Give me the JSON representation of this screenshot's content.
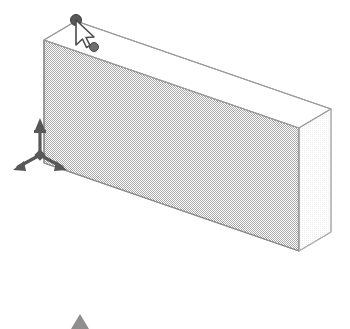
{
  "app": {
    "view_mode": "3D Isometric",
    "background_color": "#ffffff"
  },
  "viewport": {
    "width": 350,
    "height": 329,
    "name": "3d-model-viewport"
  },
  "model": {
    "object_name": "Wall Solid",
    "shape": "rectangular-box",
    "faces": {
      "front": {
        "label": "Front Face",
        "fill_color": "#d2d2d2",
        "pattern": "dither-50",
        "points": "44,40 44,163 299,251 299,128"
      },
      "top": {
        "label": "Top Face",
        "fill_color": "#ffffff",
        "points": "44,40 76,21 331,109 299,128"
      },
      "right_end": {
        "label": "Right End Cap",
        "fill_color": "#fbfbfb",
        "points": "299,128 331,109 331,232 299,251"
      }
    },
    "edge_color": "#8a8a8a",
    "edge_width": 1.1
  },
  "annotations": {
    "axis_gizmo": {
      "label": "Axis Tripod",
      "color": "#585858",
      "origin_x": 40,
      "origin_y": 155,
      "axes": [
        {
          "name": "z-axis-up",
          "dx": 0,
          "dy": -30
        },
        {
          "name": "x-axis-left",
          "dx": -24,
          "dy": 14
        },
        {
          "name": "y-axis-right",
          "dx": 24,
          "dy": 14
        }
      ]
    },
    "vertex_handles": [
      {
        "name": "selected-vertex-handle",
        "x": 76,
        "y": 20,
        "radius": 5.5,
        "color": "#595959",
        "state": "selected"
      },
      {
        "name": "secondary-grip-point",
        "x": 94,
        "y": 47,
        "radius": 4.5,
        "color": "#6e6e6e",
        "state": "unselected"
      }
    ],
    "cursor": {
      "name": "mouse-cursor",
      "x": 76,
      "y": 22,
      "fill": "#ffffff",
      "stroke": "#4a4a4a",
      "type": "arrow-pointer"
    },
    "bottom_marker": {
      "name": "bottom-triangle-marker",
      "x": 80,
      "y": 327,
      "half_width": 9,
      "height": 13,
      "color": "#8f8f8f"
    }
  }
}
